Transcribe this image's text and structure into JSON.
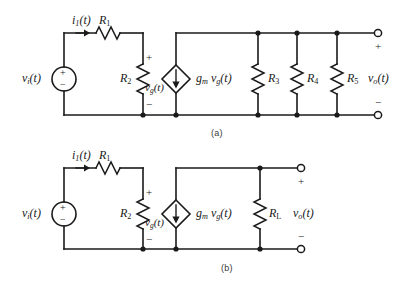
{
  "figure": {
    "captions": [
      {
        "id": "a",
        "text": "(a)",
        "x": 211,
        "y": 128
      },
      {
        "id": "b",
        "text": "(b)",
        "x": 221,
        "y": 263
      }
    ]
  },
  "circuit_a": {
    "name": "circuit-a",
    "source": {
      "label": "v",
      "sub": "i",
      "arg": "(t)",
      "plus": "+",
      "minus": "−",
      "type": "independent-voltage-source"
    },
    "current": {
      "label": "i",
      "sub": "1",
      "arg": "(t)"
    },
    "resistors": [
      {
        "name": "R1",
        "label": "R",
        "sub": "1",
        "orientation": "horizontal"
      },
      {
        "name": "R2",
        "label": "R",
        "sub": "2",
        "orientation": "vertical"
      },
      {
        "name": "R3",
        "label": "R",
        "sub": "3",
        "orientation": "vertical"
      },
      {
        "name": "R4",
        "label": "R",
        "sub": "4",
        "orientation": "vertical"
      },
      {
        "name": "R5",
        "label": "R",
        "sub": "5",
        "orientation": "vertical"
      }
    ],
    "gate_voltage": {
      "label": "v",
      "sub": "g",
      "arg": "(t)",
      "plus": "+",
      "minus": "−"
    },
    "dependent_source": {
      "type": "dependent-current-source",
      "gm": "g",
      "gm_sub": "m",
      "v": "v",
      "v_sub": "g",
      "arg": "(t)",
      "direction": "down"
    },
    "output": {
      "label": "v",
      "sub": "o",
      "arg": "(t)",
      "plus": "+",
      "minus": "−"
    }
  },
  "circuit_b": {
    "name": "circuit-b",
    "source": {
      "label": "v",
      "sub": "i",
      "arg": "(t)",
      "plus": "+",
      "minus": "−",
      "type": "independent-voltage-source"
    },
    "current": {
      "label": "i",
      "sub": "1",
      "arg": "(t)"
    },
    "resistors": [
      {
        "name": "R1",
        "label": "R",
        "sub": "1",
        "orientation": "horizontal"
      },
      {
        "name": "R2",
        "label": "R",
        "sub": "2",
        "orientation": "vertical"
      },
      {
        "name": "RL",
        "label": "R",
        "sub": "L",
        "orientation": "vertical"
      }
    ],
    "gate_voltage": {
      "label": "v",
      "sub": "g",
      "arg": "(t)",
      "plus": "+",
      "minus": "−"
    },
    "dependent_source": {
      "type": "dependent-current-source",
      "gm": "g",
      "gm_sub": "m",
      "v": "v",
      "v_sub": "g",
      "arg": "(t)",
      "direction": "down"
    },
    "output": {
      "label": "v",
      "sub": "o",
      "arg": "(t)",
      "plus": "+",
      "minus": "−"
    }
  },
  "style": {
    "wire_color": "#1a1a1a",
    "background": "#ffffff"
  }
}
